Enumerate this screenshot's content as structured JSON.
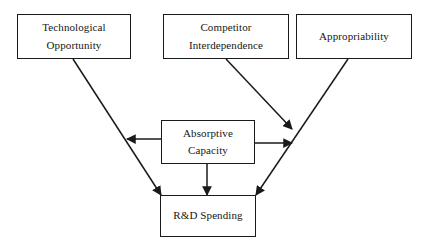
{
  "diagram": {
    "type": "flow-diagram",
    "background_color": "#ffffff",
    "line_color": "#1a1a1a",
    "text_color": "#161616",
    "nodes": [
      {
        "id": "technological-opportunity",
        "lines": [
          "Technological",
          "Opportunity"
        ],
        "line1": "Technological",
        "line2": "Opportunity"
      },
      {
        "id": "competitor-interdependence",
        "lines": [
          "Competitor",
          "Interdependence"
        ],
        "line1": "Competitor",
        "line2": "Interdependence"
      },
      {
        "id": "appropriability",
        "lines": [
          "Appropriability"
        ],
        "line1": "Appropriability",
        "line2": ""
      },
      {
        "id": "absorptive-capacity",
        "lines": [
          "Absorptive",
          "Capacity"
        ],
        "line1": "Absorptive",
        "line2": "Capacity"
      },
      {
        "id": "rd-spending",
        "lines": [
          "R&D Spending"
        ],
        "line1": "R&D Spending",
        "line2": ""
      }
    ],
    "edges": [
      {
        "id": "technological-opportunity-to-rd-spending",
        "from": "technological-opportunity",
        "to": "rd-spending",
        "arrowhead": "end"
      },
      {
        "id": "competitor-interdependence-to-appropriability-path",
        "from": "competitor-interdependence",
        "to": "appropriability-to-rd-spending",
        "arrowhead": "end"
      },
      {
        "id": "appropriability-to-rd-spending",
        "from": "appropriability",
        "to": "rd-spending",
        "arrowhead": "end"
      },
      {
        "id": "absorptive-capacity-to-technological-opportunity-path",
        "from": "absorptive-capacity",
        "to": "technological-opportunity-to-rd-spending",
        "arrowhead": "end"
      },
      {
        "id": "absorptive-capacity-to-appropriability-path",
        "from": "absorptive-capacity",
        "to": "appropriability-to-rd-spending",
        "arrowhead": "end"
      },
      {
        "id": "absorptive-capacity-to-rd-spending",
        "from": "absorptive-capacity",
        "to": "rd-spending",
        "arrowhead": "end"
      }
    ]
  }
}
